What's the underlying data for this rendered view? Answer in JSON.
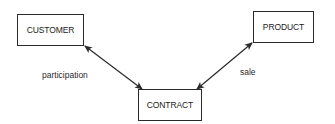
{
  "diagram": {
    "type": "entity-relationship",
    "entities": [
      {
        "id": "customer",
        "label": "CUSTOMER"
      },
      {
        "id": "product",
        "label": "PRODUCT"
      },
      {
        "id": "contract",
        "label": "CONTRACT"
      }
    ],
    "relationships": [
      {
        "from": "customer",
        "to": "contract",
        "label": "participation",
        "arrows": "both"
      },
      {
        "from": "product",
        "to": "contract",
        "label": "sale",
        "arrows": "both"
      }
    ],
    "colors": {
      "line": "#2a2a2a",
      "background": "#ffffff",
      "text": "#1a1a1a"
    }
  }
}
